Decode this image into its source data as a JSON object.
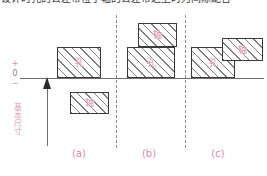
{
  "caption": {
    "text": "设计时孔的公差带位于轴的公差带之上时为间隙配合"
  },
  "axis": {
    "plus_mark": "+",
    "zero_mark": "0",
    "minus_mark": "−",
    "vertical_label": "基本尺寸",
    "zero_line_name": "zero-datum-line",
    "arrow_direction": "up"
  },
  "groups": [
    {
      "id": "a",
      "caption": "(a)",
      "boxes": [
        {
          "label": "孔",
          "role": "hole",
          "position": "above-zero-line"
        },
        {
          "label": "轴",
          "role": "shaft",
          "position": "below-zero-line"
        }
      ]
    },
    {
      "id": "b",
      "caption": "(b)",
      "boxes": [
        {
          "label": "轴",
          "role": "shaft",
          "position": "above-hole"
        },
        {
          "label": "孔",
          "role": "hole",
          "position": "on-zero-line"
        }
      ]
    },
    {
      "id": "c",
      "caption": "(c)",
      "boxes": [
        {
          "label": "孔",
          "role": "hole",
          "position": "on-zero-line"
        },
        {
          "label": "轴",
          "role": "shaft",
          "position": "overlapping-upper-right"
        }
      ]
    }
  ],
  "colors": {
    "annotation_pink": "#e08aa6",
    "line_gray": "#6e6e6e",
    "hatch_gray": "#7d7d7d",
    "box_border": "#3a3a3a"
  }
}
